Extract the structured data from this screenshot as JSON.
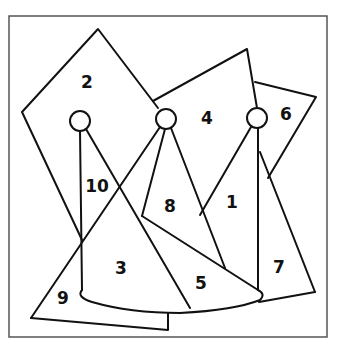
{
  "puzzle": {
    "type": "numbered-regions-line-drawing",
    "regions": [
      {
        "label": "1",
        "x": 232,
        "y": 208
      },
      {
        "label": "2",
        "x": 87,
        "y": 88
      },
      {
        "label": "3",
        "x": 121,
        "y": 274
      },
      {
        "label": "4",
        "x": 207,
        "y": 124
      },
      {
        "label": "5",
        "x": 201,
        "y": 289
      },
      {
        "label": "6",
        "x": 286,
        "y": 120
      },
      {
        "label": "7",
        "x": 279,
        "y": 273
      },
      {
        "label": "8",
        "x": 170,
        "y": 212
      },
      {
        "label": "9",
        "x": 63,
        "y": 304
      },
      {
        "label": "10",
        "x": 97,
        "y": 192
      }
    ],
    "colors": {
      "line": "#111111",
      "frame": "#555555",
      "background": "#ffffff"
    }
  }
}
